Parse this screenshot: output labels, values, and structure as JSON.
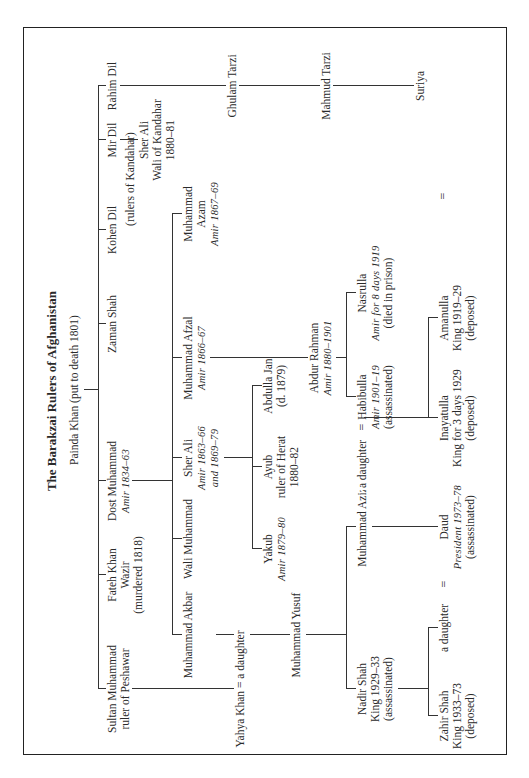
{
  "title": "The Barakzai Rulers of Afghanistan",
  "root": {
    "name": "Painda Khan (put to death 1801)"
  },
  "generation1": [
    {
      "name": "Sultan Muhammad",
      "line2": "ruler of Peshawar"
    },
    {
      "name": "Fateh Khan",
      "line2": "Wazir",
      "line3": "(murdered 1818)"
    },
    {
      "name": "Dost Muhammad",
      "line2": "Amir 1834–63"
    },
    {
      "name": "Zaman Shah"
    },
    {
      "name": "Kohen Dil"
    },
    {
      "name": "Mir Dil"
    },
    {
      "name": "Rahim Dil"
    }
  ],
  "kandahar_note": "(rulers of Kandahar)",
  "sher_ali_kandahar": {
    "name": "Sher Ali",
    "line2": "Wali of Kandahar",
    "line3": "1880–81"
  },
  "tarzi": [
    {
      "name": "Ghulam Tarzi"
    },
    {
      "name": "Mahmud Tarzi"
    },
    {
      "name": "Suriya"
    }
  ],
  "yahya": {
    "label": "Yahya Khan = a daughter"
  },
  "dost_children": [
    {
      "name": "Muhammad Akbar"
    },
    {
      "name": "Wali Muhammad"
    },
    {
      "name": "Sher Ali",
      "line2": "Amir 1863–66",
      "line3": "and 1869–79"
    },
    {
      "name": "Muhammad Afzal",
      "line2": "Amir 1866–67"
    },
    {
      "name": "Muhammad",
      "line2": "Azam",
      "line3": "Amir 1867–69"
    }
  ],
  "sher_ali_children": [
    {
      "name": "Yakub",
      "line2": "Amir 1879–80"
    },
    {
      "name": "Ayub",
      "line2": "ruler of Herat",
      "line3": "1880–82"
    },
    {
      "name": "Abdulla Jan",
      "line2": "(d. 1879)"
    }
  ],
  "abdur_rahman": {
    "name": "Abdur Rahman",
    "line2": "Amir 1880–1901"
  },
  "abdur_children": [
    {
      "name": "Habibulla",
      "line2": "Amir 1901–19",
      "line3": "(assassinated)"
    },
    {
      "name": "Nasrulla",
      "line2": "Amir for 8 days 1919",
      "line3": "(died in prison)"
    }
  ],
  "muhammad_yusuf": {
    "name": "Muhammad Yusuf"
  },
  "yusuf_children": [
    {
      "name": "Nadir Shah",
      "line2": "King 1929–33",
      "line3": "(assassinated)"
    },
    {
      "name": "Muhammad Aziz"
    },
    {
      "name": "a daughter"
    }
  ],
  "habibulla_children": [
    {
      "name": "Inayatulla",
      "line2": "King for 3 days 1929",
      "line3": "(deposed)"
    },
    {
      "name": "Amanulla",
      "line2": "King 1919–29",
      "line3": "(deposed)"
    }
  ],
  "nadir_children": [
    {
      "name": "Zahir Shah",
      "line2": "King 1933–73",
      "line3": "(deposed)"
    },
    {
      "name": "a daughter"
    }
  ],
  "daud": {
    "name": "Daud",
    "line2": "President 1973–78",
    "line3": "(assassinated)"
  },
  "marriage_symbol": "="
}
